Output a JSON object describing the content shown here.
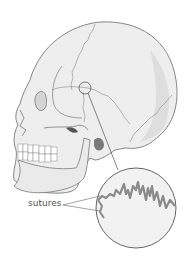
{
  "figure": {
    "labels": [
      {
        "id": "sutures",
        "text": "sutures"
      }
    ],
    "callout": {
      "description": "magnified view of cranial suture"
    }
  },
  "colors": {
    "bone_fill": "#eeeeee",
    "bone_shade": "#d8d8d8",
    "outline": "#6a6a6a",
    "suture_line": "#8a8a8a",
    "text": "#555555"
  }
}
